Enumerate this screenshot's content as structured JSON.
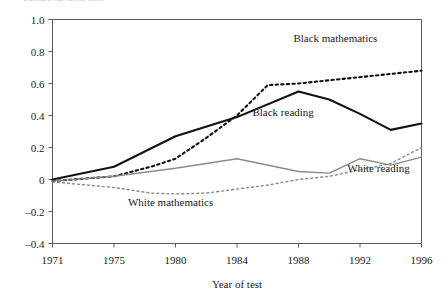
{
  "figure": {
    "clipped_header_text": "Standard deviation units",
    "background": "#ffffff",
    "axis_color": "#555b60"
  },
  "chart_data": {
    "type": "line",
    "title": "",
    "xlabel": "Year of test",
    "ylabel": "",
    "x": [
      1971,
      1975,
      1980,
      1984,
      1988,
      1992,
      1996
    ],
    "xtick_labels": [
      "1971",
      "1975",
      "1980",
      "1984",
      "1988",
      "1992",
      "1996"
    ],
    "ylim": [
      -0.4,
      1.0
    ],
    "ytick_values": [
      1.0,
      0.8,
      0.6,
      0.4,
      0.2,
      0,
      -0.2,
      -0.4
    ],
    "ytick_labels": [
      "1.0",
      "0.8",
      "0.6",
      "0.4",
      "0.2",
      "0",
      "–0.2",
      "–0.4"
    ],
    "grid": false,
    "legend": "inline-annotations",
    "series": [
      {
        "name": "Black mathematics",
        "color": "#111111",
        "style": "dashed",
        "width": 2.1,
        "label_x": 1990.4,
        "label_y": 0.86,
        "label_anchor": "middle",
        "points": [
          {
            "x": 1971,
            "y": -0.01
          },
          {
            "x": 1973,
            "y": 0.005
          },
          {
            "x": 1975,
            "y": 0.02
          },
          {
            "x": 1978,
            "y": 0.08
          },
          {
            "x": 1980,
            "y": 0.13
          },
          {
            "x": 1982,
            "y": 0.26
          },
          {
            "x": 1984,
            "y": 0.4
          },
          {
            "x": 1986,
            "y": 0.59
          },
          {
            "x": 1988,
            "y": 0.6
          },
          {
            "x": 1990,
            "y": 0.62
          },
          {
            "x": 1992,
            "y": 0.64
          },
          {
            "x": 1994,
            "y": 0.66
          },
          {
            "x": 1996,
            "y": 0.68
          }
        ]
      },
      {
        "name": "Black reading",
        "color": "#111111",
        "style": "solid",
        "width": 2.1,
        "label_x": 1987.0,
        "label_y": 0.4,
        "label_anchor": "middle",
        "points": [
          {
            "x": 1971,
            "y": 0.0
          },
          {
            "x": 1975,
            "y": 0.08
          },
          {
            "x": 1980,
            "y": 0.27
          },
          {
            "x": 1984,
            "y": 0.39
          },
          {
            "x": 1988,
            "y": 0.55
          },
          {
            "x": 1990,
            "y": 0.5
          },
          {
            "x": 1992,
            "y": 0.41
          },
          {
            "x": 1994,
            "y": 0.31
          },
          {
            "x": 1996,
            "y": 0.35
          }
        ]
      },
      {
        "name": "White reading",
        "color": "#8a8a8a",
        "style": "solid",
        "width": 1.4,
        "label_x": 1993.2,
        "label_y": 0.05,
        "label_anchor": "middle",
        "points": [
          {
            "x": 1971,
            "y": -0.01
          },
          {
            "x": 1975,
            "y": 0.02
          },
          {
            "x": 1980,
            "y": 0.07
          },
          {
            "x": 1984,
            "y": 0.13
          },
          {
            "x": 1988,
            "y": 0.05
          },
          {
            "x": 1990,
            "y": 0.04
          },
          {
            "x": 1992,
            "y": 0.13
          },
          {
            "x": 1994,
            "y": 0.09
          },
          {
            "x": 1996,
            "y": 0.14
          }
        ]
      },
      {
        "name": "White mathematics",
        "color": "#8a8a8a",
        "style": "dashed",
        "width": 1.4,
        "label_x": 1979.6,
        "label_y": -0.165,
        "label_anchor": "middle",
        "points": [
          {
            "x": 1971,
            "y": -0.015
          },
          {
            "x": 1975,
            "y": -0.05
          },
          {
            "x": 1978,
            "y": -0.085
          },
          {
            "x": 1980,
            "y": -0.09
          },
          {
            "x": 1982,
            "y": -0.085
          },
          {
            "x": 1984,
            "y": -0.06
          },
          {
            "x": 1986,
            "y": -0.035
          },
          {
            "x": 1988,
            "y": 0.0
          },
          {
            "x": 1990,
            "y": 0.02
          },
          {
            "x": 1992,
            "y": 0.06
          },
          {
            "x": 1994,
            "y": 0.1
          },
          {
            "x": 1996,
            "y": 0.2
          }
        ]
      }
    ]
  }
}
